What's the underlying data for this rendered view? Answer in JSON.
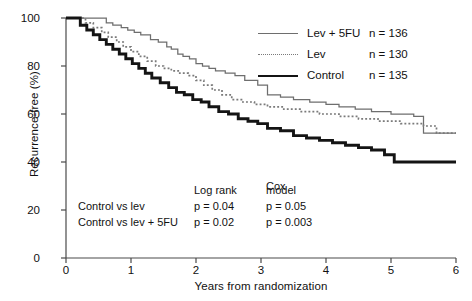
{
  "axes": {
    "ylabel": "Recurrence-free (%)",
    "xlabel": "Years from randomization",
    "yticks": [
      "100",
      "80",
      "60",
      "40",
      "20",
      "0"
    ],
    "xticks": [
      "0",
      "1",
      "2",
      "3",
      "4",
      "5",
      "6"
    ]
  },
  "legend": {
    "items": [
      {
        "label": "Lev + 5FU",
        "n": "n = 136",
        "style": "thin-solid"
      },
      {
        "label": "Lev",
        "n": "n = 130",
        "style": "dotted"
      },
      {
        "label": "Control",
        "n": "n = 135",
        "style": "thick-solid"
      }
    ]
  },
  "stats": {
    "header_cox_line1": "Cox",
    "header_logrank": "Log rank",
    "header_cox_line2": "model",
    "rows": [
      {
        "comparison": "Control vs lev",
        "logrank": "p = 0.04",
        "cox": "p = 0.05"
      },
      {
        "comparison": "Control vs lev + 5FU",
        "logrank": "p = 0.02",
        "cox": "p = 0.003"
      }
    ]
  },
  "chart_data": {
    "type": "line",
    "title": "",
    "xlabel": "Years from randomization",
    "ylabel": "Recurrence-free (%)",
    "xlim": [
      0,
      6
    ],
    "ylim": [
      0,
      100
    ],
    "grid": false,
    "legend_position": "top-right",
    "step": "post",
    "series": [
      {
        "name": "Lev + 5FU",
        "n": 136,
        "style": "thin-solid",
        "color": "#6e6e6e",
        "x": [
          0,
          0.45,
          0.62,
          0.72,
          0.85,
          0.95,
          1.05,
          1.15,
          1.3,
          1.42,
          1.55,
          1.62,
          1.72,
          1.8,
          1.9,
          2.0,
          2.1,
          2.2,
          2.3,
          2.45,
          2.6,
          2.75,
          2.95,
          3.1,
          3.3,
          3.5,
          3.75,
          4.0,
          4.2,
          4.45,
          4.7,
          5.0,
          5.35,
          5.5,
          6.0
        ],
        "y": [
          100,
          100,
          98,
          97,
          96,
          95,
          94,
          93,
          91,
          90,
          88,
          87,
          85,
          84,
          83,
          81,
          80,
          79,
          78,
          77,
          76,
          74,
          72,
          68,
          67,
          66,
          65,
          64,
          63,
          62,
          61,
          60,
          59,
          52,
          52
        ]
      },
      {
        "name": "Lev",
        "n": 130,
        "style": "dotted",
        "color": "#7a7a7a",
        "x": [
          0,
          0.3,
          0.42,
          0.55,
          0.65,
          0.78,
          0.88,
          1.0,
          1.12,
          1.25,
          1.38,
          1.5,
          1.62,
          1.75,
          1.88,
          2.0,
          2.12,
          2.25,
          2.4,
          2.55,
          2.7,
          2.9,
          3.1,
          3.35,
          3.6,
          3.9,
          4.2,
          4.5,
          4.8,
          5.15,
          5.5,
          5.7,
          6.0
        ],
        "y": [
          100,
          98,
          96,
          94,
          92,
          90,
          88,
          86,
          84,
          82,
          80,
          79,
          78,
          77,
          76,
          74,
          72,
          70,
          68,
          66,
          65,
          64,
          63,
          62,
          61,
          60,
          59,
          58,
          57,
          56,
          55,
          52,
          52
        ]
      },
      {
        "name": "Control",
        "n": 135,
        "style": "thick-solid",
        "color": "#141414",
        "x": [
          0,
          0.22,
          0.32,
          0.42,
          0.52,
          0.62,
          0.72,
          0.82,
          0.92,
          1.02,
          1.12,
          1.22,
          1.32,
          1.45,
          1.58,
          1.7,
          1.82,
          1.95,
          2.08,
          2.2,
          2.35,
          2.5,
          2.65,
          2.8,
          2.95,
          3.1,
          3.3,
          3.5,
          3.7,
          3.9,
          4.1,
          4.3,
          4.5,
          4.7,
          4.9,
          5.05,
          6.0
        ],
        "y": [
          100,
          97,
          95,
          93,
          91,
          89,
          87,
          85,
          83,
          81,
          79,
          77,
          75,
          73,
          71,
          69,
          68,
          66,
          65,
          63,
          61,
          60,
          58,
          57,
          56,
          54,
          53,
          51,
          50,
          49,
          48,
          47,
          46,
          45,
          43,
          40,
          40
        ]
      }
    ]
  }
}
